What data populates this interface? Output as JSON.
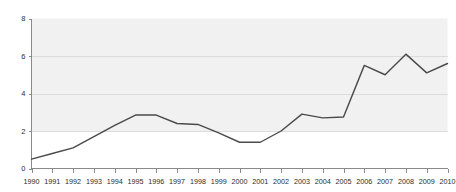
{
  "chart_data": {
    "type": "line",
    "title": "",
    "subtitle": "",
    "xlabel": "",
    "ylabel": "",
    "grid": true,
    "legend": false,
    "legend_position": "none",
    "xlim": [
      1990,
      2010
    ],
    "ylim": [
      0,
      8
    ],
    "x_tick_labels": [
      "1990",
      "1991",
      "1992",
      "1993",
      "1994",
      "1995",
      "1996",
      "1997",
      "1998",
      "1999",
      "2000",
      "2001",
      "2002",
      "2003",
      "2004",
      "2005",
      "2006",
      "2007",
      "2008",
      "2009",
      "2010"
    ],
    "y_tick_labels": [
      "0",
      "2",
      "4",
      "6",
      "8"
    ],
    "y_ticks": [
      0,
      2,
      4,
      6,
      8
    ],
    "gridline_values": [
      2,
      4,
      6
    ],
    "shaded_band": [
      2,
      8
    ],
    "categories": [
      1990,
      1991,
      1992,
      1993,
      1994,
      1995,
      1996,
      1997,
      1998,
      1999,
      2000,
      2001,
      2002,
      2003,
      2004,
      2005,
      2006,
      2007,
      2008,
      2009,
      2010
    ],
    "values": [
      0.5,
      0.8,
      1.1,
      1.7,
      2.3,
      2.85,
      2.85,
      2.4,
      2.35,
      1.9,
      1.4,
      1.4,
      2.0,
      2.9,
      2.7,
      2.75,
      5.5,
      5.0,
      6.1,
      5.1,
      5.6
    ],
    "series": [
      {
        "name": "series-1",
        "color": "#4a4a4a",
        "values": [
          0.5,
          0.8,
          1.1,
          1.7,
          2.3,
          2.85,
          2.85,
          2.4,
          2.35,
          1.9,
          1.4,
          1.4,
          2.0,
          2.9,
          2.7,
          2.75,
          5.5,
          5.0,
          6.1,
          5.1,
          5.6
        ]
      }
    ]
  },
  "style": {
    "line_color": "#4a4a4a",
    "band_color": "#f1f1f1",
    "grid_color": "#dcdcdc",
    "axis_color": "#8a8a8a",
    "text_color": "#2b2b2b",
    "background": "#ffffff"
  }
}
